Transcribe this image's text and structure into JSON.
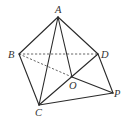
{
  "diagram": {
    "type": "geometry-figure",
    "points": {
      "A": {
        "label": "A",
        "x": 58,
        "y": 17
      },
      "B": {
        "label": "B",
        "x": 19,
        "y": 54
      },
      "C": {
        "label": "C",
        "x": 39,
        "y": 105
      },
      "D": {
        "label": "D",
        "x": 98,
        "y": 54
      },
      "O": {
        "label": "O",
        "x": 72,
        "y": 77
      },
      "P": {
        "label": "P",
        "x": 113,
        "y": 93
      }
    },
    "edges_solid": [
      "AB",
      "AC",
      "AD",
      "AO",
      "BC",
      "CD",
      "CP",
      "OP",
      "DP"
    ],
    "edges_dashed": [
      "BD",
      "BO"
    ],
    "colors": {
      "line": "#2a2a2a",
      "dashed": "#555555",
      "label": "#333333",
      "background": "#ffffff"
    }
  }
}
